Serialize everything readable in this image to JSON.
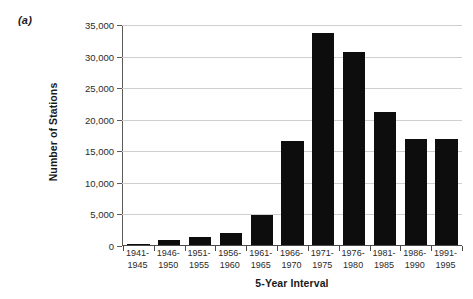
{
  "panel": {
    "label": "(a)"
  },
  "chart_data": {
    "type": "bar",
    "title": "",
    "xlabel": "5-Year Interval",
    "ylabel": "Number of Stations",
    "categories": [
      "1941-1945",
      "1946-1950",
      "1951-1955",
      "1956-1960",
      "1961-1965",
      "1966-1970",
      "1971-1975",
      "1976-1980",
      "1981-1985",
      "1986-1990",
      "1991-1995"
    ],
    "category_lines": [
      [
        "1941-",
        "1945"
      ],
      [
        "1946-",
        "1950"
      ],
      [
        "1951-",
        "1955"
      ],
      [
        "1956-",
        "1960"
      ],
      [
        "1961-",
        "1965"
      ],
      [
        "1966-",
        "1970"
      ],
      [
        "1971-",
        "1975"
      ],
      [
        "1976-",
        "1980"
      ],
      [
        "1981-",
        "1985"
      ],
      [
        "1986-",
        "1990"
      ],
      [
        "1991-",
        "1995"
      ]
    ],
    "values": [
      200,
      800,
      1200,
      1900,
      4700,
      16500,
      33500,
      30500,
      21000,
      16800,
      16800
    ],
    "ylim": [
      0,
      35000
    ],
    "yticks": [
      0,
      5000,
      10000,
      15000,
      20000,
      25000,
      30000,
      35000
    ],
    "ytick_labels": [
      "0",
      "5,000",
      "10,000",
      "15,000",
      "20,000",
      "25,000",
      "30,000",
      "35,000"
    ],
    "grid": true,
    "legend": "none",
    "bar_color": "#0d0d0d",
    "grid_color": "#cfcfcf",
    "axis_color": "#4a4a4a"
  }
}
